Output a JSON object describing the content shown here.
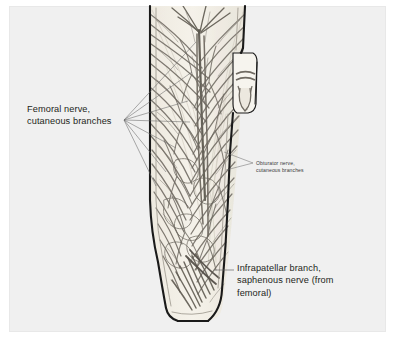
{
  "figure": {
    "background_color": "#ffffff",
    "plate_color": "#f0f0f0",
    "skin_fill": "#f3efe6",
    "nerve_color": "#6f6a62",
    "outline_color": "#1a1a1a",
    "leader_color": "#555555",
    "text_color": "#231f20"
  },
  "labels": {
    "femoral": {
      "line1": "Femoral nerve,",
      "line2": "cutaneous branches"
    },
    "obturator": {
      "line1": "Obturator nerve,",
      "line2": "cutaneous branches"
    },
    "infrapatellar": {
      "line1": "Infrapatellar branch,",
      "line2": "saphenous nerve (from",
      "line3": "femoral)"
    }
  }
}
